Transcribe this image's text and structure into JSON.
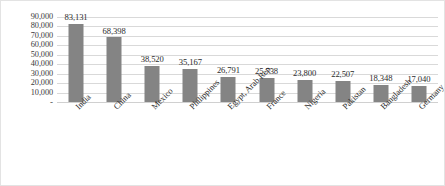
{
  "chart_data": {
    "type": "bar",
    "title": "",
    "xlabel": "",
    "ylabel": "",
    "categories": [
      "India",
      "China",
      "Mexico",
      "Philippines",
      "Egypt, Arab Rep.",
      "France",
      "Nigeria",
      "Pakistan",
      "Bangladesh",
      "Germany"
    ],
    "values": [
      83131,
      68398,
      38520,
      35167,
      26791,
      25738,
      23800,
      22507,
      18348,
      17040
    ],
    "value_labels": [
      "83,131",
      "68,398",
      "38,520",
      "35,167",
      "26,791",
      "25,738",
      "23,800",
      "22,507",
      "18,348",
      "17,040"
    ],
    "ylim": [
      0,
      90000
    ],
    "ytick_values": [
      90000,
      80000,
      70000,
      60000,
      50000,
      40000,
      30000,
      20000,
      10000,
      0
    ],
    "ytick_labels": [
      "90,000",
      "80,000",
      "70,000",
      "60,000",
      "50,000",
      "40,000",
      "30,000",
      "20,000",
      "10,000",
      "-"
    ],
    "grid": true,
    "gridline_orientation": "horizontal",
    "legend": false,
    "legend_position": "none",
    "bar_color": "#848484",
    "gridline_color": "#d9d9d9",
    "background_color": "#ffffff",
    "border_color": "#e3e3e3",
    "xtick_label_rotation_deg": -45
  }
}
